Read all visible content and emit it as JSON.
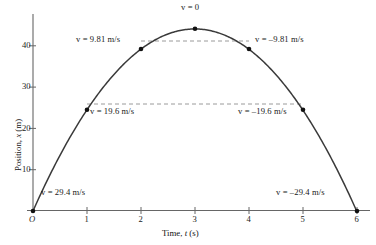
{
  "chart_data": {
    "type": "line",
    "title": "",
    "xlabel": "Time, t (s)",
    "ylabel": "Position, x (m)",
    "xlim": [
      0,
      6
    ],
    "ylim": [
      0,
      47
    ],
    "grid": false,
    "legend": "none",
    "x": [
      0,
      1,
      2,
      3,
      4,
      5,
      6
    ],
    "values": [
      0,
      24.5,
      39.2,
      44.1,
      39.2,
      24.5,
      0
    ],
    "series": [
      {
        "name": "Position",
        "x": [
          0,
          1,
          2,
          3,
          4,
          5,
          6
        ],
        "values": [
          0,
          24.5,
          39.2,
          44.1,
          39.2,
          24.5,
          0
        ]
      }
    ],
    "equation": "x = 29.4t - 4.905t^2",
    "xticks": [
      0,
      1,
      2,
      3,
      4,
      5,
      6
    ],
    "xtick_labels": [
      "O",
      "1",
      "2",
      "3",
      "4",
      "5",
      "6"
    ],
    "yticks": [
      10,
      20,
      30,
      40
    ],
    "ytick_labels": [
      "10",
      "20",
      "30",
      "40"
    ],
    "markers": [
      {
        "t": 0,
        "x": 0,
        "velocity": 29.4,
        "label": "v = 29.4 m/s"
      },
      {
        "t": 1,
        "x": 24.5,
        "velocity": 19.6,
        "label": "v = 19.6 m/s"
      },
      {
        "t": 2,
        "x": 39.2,
        "velocity": 9.81,
        "label": "v = 9.81 m/s"
      },
      {
        "t": 3,
        "x": 44.1,
        "velocity": 0,
        "label": "v = 0"
      },
      {
        "t": 4,
        "x": 39.2,
        "velocity": -9.81,
        "label": "v = –9.81 m/s"
      },
      {
        "t": 5,
        "x": 24.5,
        "velocity": -19.6,
        "label": "v = –19.6 m/s"
      },
      {
        "t": 6,
        "x": 0,
        "velocity": -29.4,
        "label": "v = –29.4 m/s"
      }
    ],
    "dashed_levels": [
      39.2,
      24.5
    ],
    "colors": {
      "curve": "#3a3a3a",
      "axis": "#555555",
      "marker": "#111111",
      "dashed": "#999999",
      "text": "#181818"
    }
  },
  "annotations": {
    "v_top": "v = 0",
    "v_left_981": "v = 9.81 m/s",
    "v_right_981": "v = –9.81 m/s",
    "v_left_196": "v = 19.6 m/s",
    "v_right_196": "v = –19.6 m/s",
    "v_left_294": "v = 29.4 m/s",
    "v_right_294": "v = –29.4 m/s"
  },
  "axes": {
    "x_title": "Time, t (s)",
    "y_title": "Position, x (m)",
    "x_title_prefix": "Time, ",
    "x_title_var": "t",
    "x_title_unit": " (s)",
    "y_title_prefix": "Position, ",
    "y_title_var": "x",
    "y_title_unit": " (m)",
    "origin_label": "O",
    "xtick_1": "1",
    "xtick_2": "2",
    "xtick_3": "3",
    "xtick_4": "4",
    "xtick_5": "5",
    "xtick_6": "6",
    "ytick_10": "10",
    "ytick_20": "20",
    "ytick_30": "30",
    "ytick_40": "40"
  }
}
